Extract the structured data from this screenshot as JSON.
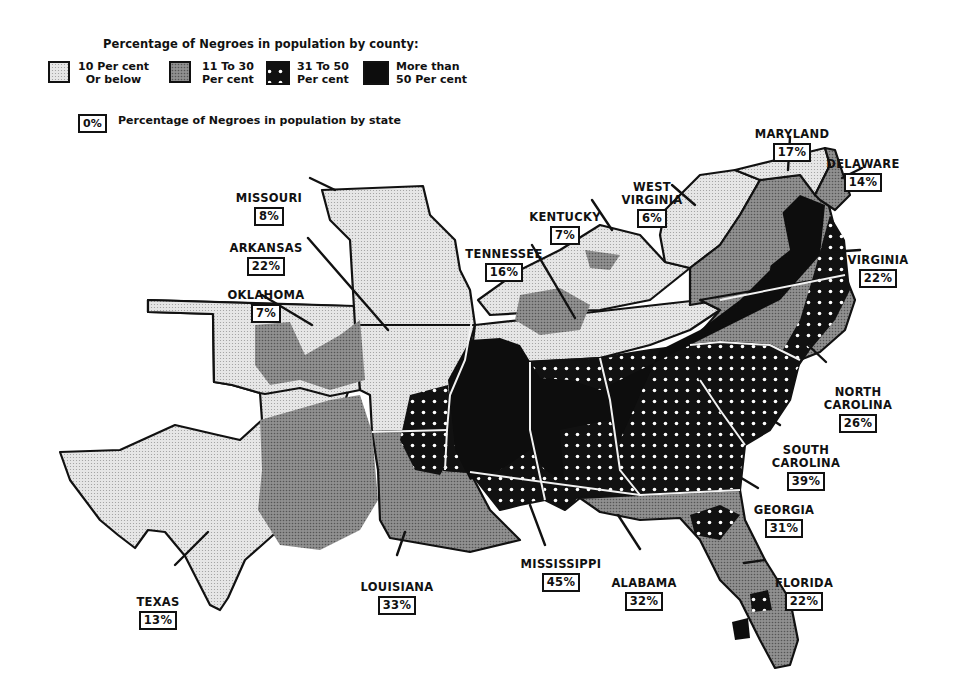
{
  "legend": {
    "title": "Percentage of Negroes in population by county:",
    "categories": [
      {
        "label": "10 Per cent\nOr below",
        "pattern": "light-dot",
        "color": "#d9d9d9"
      },
      {
        "label": "11 To 30\nPer cent",
        "pattern": "medium-gray",
        "color": "#8c8c8c"
      },
      {
        "label": "31 To 50\nPer cent",
        "pattern": "black-white-dots",
        "color": "#141414"
      },
      {
        "label": "More than\n50 Per cent",
        "pattern": "solid-black",
        "color": "#0a0a0a"
      }
    ],
    "state_key_box": "0%",
    "state_key_text": "Percentage of Negroes in population by state"
  },
  "states": [
    {
      "name": "MISSOURI",
      "pct": "8%"
    },
    {
      "name": "ARKANSAS",
      "pct": "22%"
    },
    {
      "name": "OKLAHOMA",
      "pct": "7%"
    },
    {
      "name": "TENNESSEE",
      "pct": "16%"
    },
    {
      "name": "KENTUCKY",
      "pct": "7%"
    },
    {
      "name": "WEST\nVIRGINIA",
      "pct": "6%"
    },
    {
      "name": "MARYLAND",
      "pct": "17%"
    },
    {
      "name": "DELAWARE",
      "pct": "14%"
    },
    {
      "name": "VIRGINIA",
      "pct": "22%"
    },
    {
      "name": "NORTH\nCAROLINA",
      "pct": "26%"
    },
    {
      "name": "SOUTH\nCAROLINA",
      "pct": "39%"
    },
    {
      "name": "GEORGIA",
      "pct": "31%"
    },
    {
      "name": "FLORIDA",
      "pct": "22%"
    },
    {
      "name": "ALABAMA",
      "pct": "32%"
    },
    {
      "name": "MISSISSIPPI",
      "pct": "45%"
    },
    {
      "name": "LOUISIANA",
      "pct": "33%"
    },
    {
      "name": "TEXAS",
      "pct": "13%"
    }
  ]
}
